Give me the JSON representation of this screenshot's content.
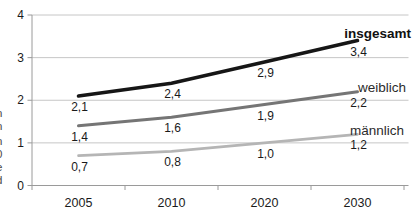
{
  "figure": {
    "background": "#ffffff",
    "left_clipped_text_fragments": [
      ":",
      "n",
      "n",
      "n",
      "0",
      "e",
      "d",
      ")"
    ]
  },
  "chart_data": {
    "type": "line",
    "title": "",
    "xlabel": "",
    "ylabel": "",
    "categories": [
      "2005",
      "2010",
      "2020",
      "2030"
    ],
    "series": [
      {
        "name": "insgesamt",
        "values": [
          2.1,
          2.4,
          2.9,
          3.4
        ],
        "value_labels": [
          "2,1",
          "2,4",
          "2,9",
          "3,4"
        ],
        "color": "#161616",
        "stroke_width": 3.6,
        "bold_name": true
      },
      {
        "name": "weiblich",
        "values": [
          1.4,
          1.6,
          1.9,
          2.2
        ],
        "value_labels": [
          "1,4",
          "1,6",
          "1,9",
          "2,2"
        ],
        "color": "#757575",
        "stroke_width": 3.0,
        "bold_name": false
      },
      {
        "name": "männlich",
        "values": [
          0.7,
          0.8,
          1.0,
          1.2
        ],
        "value_labels": [
          "0,7",
          "0,8",
          "1,0",
          "1,2"
        ],
        "color": "#b5b5b5",
        "stroke_width": 2.6,
        "bold_name": false
      }
    ],
    "y_ticks": [
      "0",
      "1",
      "2",
      "3",
      "4"
    ],
    "ylim": [
      0,
      4
    ],
    "grid": true,
    "legend_position": "end-of-line-labels-right",
    "colors": {
      "grid": "#c6c6c6",
      "axis": "#9a9a9a",
      "tick_text": "#1a1a1a",
      "value_text": "#1a1a1a",
      "series_name_text": "#2b2b2b"
    }
  }
}
